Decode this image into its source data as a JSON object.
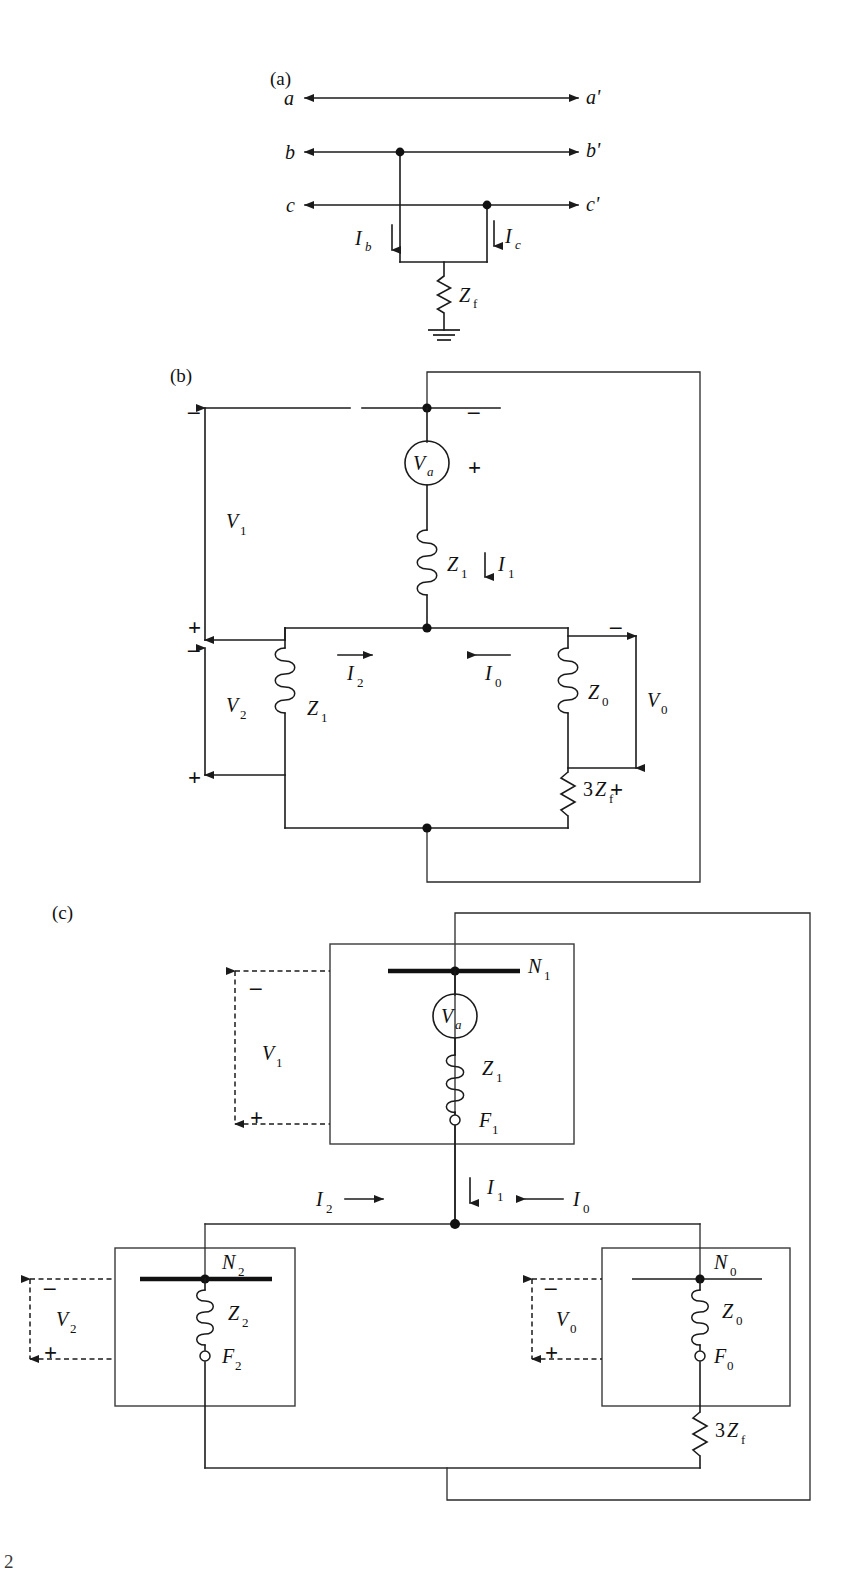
{
  "figure": {
    "panels": [
      {
        "id": "a",
        "label": "(a)",
        "caption": "Double line-to-ground fault on phases b and c through impedance Zf",
        "phase_terminals_left": [
          "a",
          "b",
          "c"
        ],
        "phase_terminals_right": [
          "a'",
          "b'",
          "c'"
        ],
        "currents": [
          "I_b",
          "I_c"
        ],
        "impedances": [
          "Z_f"
        ],
        "ground_symbol": "earth-ground"
      },
      {
        "id": "b",
        "label": "(b)",
        "caption": "Sequence networks connected for a double line-to-ground fault",
        "source": "V_a",
        "impedances": [
          "Z_1",
          "Z_1",
          "Z_0",
          "3Z_f"
        ],
        "currents": [
          "I_1",
          "I_2",
          "I_0"
        ],
        "voltages": [
          "V_1",
          "V_2",
          "V_0"
        ],
        "polarity_marks": [
          "-",
          "+",
          "-",
          "+",
          "-",
          "+"
        ]
      },
      {
        "id": "c",
        "label": "(c)",
        "caption": "Sequence networks shown as boxes with N and F terminals",
        "networks": [
          {
            "name": "positive-sequence",
            "bus": "N_1",
            "fault": "F_1",
            "impedance": "Z_1",
            "voltage": "V_0"
          },
          {
            "name": "negative-sequence",
            "bus": "N_2",
            "fault": "F_2",
            "impedance": "Z_2",
            "voltage": "V_2"
          },
          {
            "name": "zero-sequence",
            "bus": "N_0",
            "fault": "F_0",
            "impedance": "Z_0",
            "voltage": "V_0"
          }
        ],
        "source": "V_a",
        "currents": [
          "I_1",
          "I_2",
          "I_0"
        ],
        "voltages": [
          "V_1",
          "V_2",
          "V_0"
        ],
        "fault_impedance": "3Z_f"
      }
    ]
  },
  "labels": {
    "part_a": "(a)",
    "part_b": "(b)",
    "part_c": "(c)",
    "term_a": "a",
    "term_ap": "a'",
    "term_b": "b",
    "term_bp": "b'",
    "term_c": "c",
    "term_cp": "c'",
    "V": "V",
    "I": "I",
    "Z": "Z",
    "N": "N",
    "F": "F",
    "sub_a": "a",
    "sub_b": "b",
    "sub_c": "c",
    "sub_f": "f",
    "sub_0": "0",
    "sub_1": "1",
    "sub_2": "2",
    "three": "3",
    "plus": "+",
    "minus": "–",
    "page_artifact": "2"
  },
  "colors": {
    "ink": "#111111",
    "wire": "#1b1b1b",
    "box": "#3a3a3a",
    "background": "#ffffff"
  }
}
